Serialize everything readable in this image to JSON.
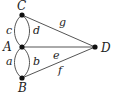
{
  "diagram": {
    "type": "graph",
    "colors": {
      "edge": "#555555",
      "node": "#111111",
      "text": "#222222",
      "background": "#ffffff"
    },
    "nodes": [
      {
        "id": "C",
        "label": "C",
        "x": 22,
        "y": 15
      },
      {
        "id": "A",
        "label": "A",
        "x": 22,
        "y": 47
      },
      {
        "id": "B",
        "label": "B",
        "x": 22,
        "y": 78
      },
      {
        "id": "D",
        "label": "D",
        "x": 95,
        "y": 47
      }
    ],
    "edges": [
      {
        "id": "c",
        "label": "c",
        "from": "C",
        "to": "A",
        "curve": "left"
      },
      {
        "id": "d",
        "label": "d",
        "from": "C",
        "to": "A",
        "curve": "right"
      },
      {
        "id": "a",
        "label": "a",
        "from": "A",
        "to": "B",
        "curve": "left"
      },
      {
        "id": "b",
        "label": "b",
        "from": "A",
        "to": "B",
        "curve": "right"
      },
      {
        "id": "g",
        "label": "g",
        "from": "C",
        "to": "D",
        "curve": "straight"
      },
      {
        "id": "e",
        "label": "e",
        "from": "A",
        "to": "D",
        "curve": "straight"
      },
      {
        "id": "f",
        "label": "f",
        "from": "B",
        "to": "D",
        "curve": "straight"
      }
    ]
  }
}
